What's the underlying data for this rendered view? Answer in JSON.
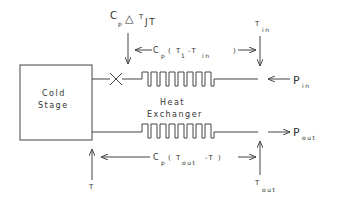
{
  "diagram": {
    "cold_stage": {
      "line1": "Cold",
      "line2": "Stage"
    },
    "heat_exchanger": {
      "line1": "Heat",
      "line2": "Exchanger"
    },
    "labels": {
      "jt_main": "C",
      "jt_sub_p": "p",
      "jt_delta": "△",
      "jt_T": "T",
      "jt_sub": "JT",
      "top_flow_C": "C",
      "top_flow_p": "p",
      "top_flow_open": "( T",
      "top_flow_sub1": "1",
      "top_flow_minus": "-T",
      "top_flow_sub2": "in",
      "top_flow_close": ")",
      "tin_T": "T",
      "tin_sub": "in",
      "pin_P": "P",
      "pin_sub": "in",
      "pout_P": "P",
      "pout_sub": "out",
      "bottom_flow_C": "C",
      "bottom_flow_p": "p",
      "bottom_flow_open": "( T",
      "bottom_flow_sub": "out",
      "bottom_flow_minus": "-T )",
      "t_label": "T",
      "tout_T": "T",
      "tout_sub": "out"
    }
  }
}
